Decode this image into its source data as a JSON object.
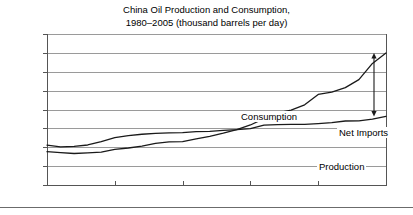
{
  "chart_data": {
    "type": "line",
    "title": "China Oil Production and Consumption,",
    "subtitle": "1980–2005 (thousand barrels per day)",
    "xlabel": "",
    "ylabel": "",
    "xlim": [
      1980,
      2005
    ],
    "ylim": [
      0,
      8000
    ],
    "grid": true,
    "legend_position": "inline-annotations",
    "x_ticks": [
      "1980",
      "1985",
      "1990",
      "1995",
      "2000",
      "2005"
    ],
    "x_tick_values": [
      1980,
      1985,
      1990,
      1995,
      2000,
      2005
    ],
    "y_ticks": [
      "0",
      "1,000",
      "2,000",
      "3,000",
      "4,000",
      "5,000",
      "6,000",
      "7,000",
      "8,000"
    ],
    "y_tick_values": [
      0,
      1000,
      2000,
      3000,
      4000,
      5000,
      6000,
      7000,
      8000
    ],
    "x": [
      1980,
      1981,
      1982,
      1983,
      1984,
      1985,
      1986,
      1987,
      1988,
      1989,
      1990,
      1991,
      1992,
      1993,
      1994,
      1995,
      1996,
      1997,
      1998,
      1999,
      2000,
      2001,
      2002,
      2003,
      2004,
      2005
    ],
    "series": [
      {
        "name": "Consumption",
        "values": [
          1765,
          1710,
          1670,
          1700,
          1740,
          1885,
          1960,
          2060,
          2210,
          2290,
          2300,
          2440,
          2580,
          2750,
          2940,
          3180,
          3520,
          3820,
          3970,
          4250,
          4800,
          4920,
          5160,
          5580,
          6440,
          6990
        ]
      },
      {
        "name": "Production",
        "values": [
          2114,
          2020,
          2045,
          2120,
          2295,
          2505,
          2620,
          2690,
          2730,
          2760,
          2780,
          2830,
          2840,
          2890,
          2930,
          2990,
          3170,
          3200,
          3210,
          3210,
          3250,
          3300,
          3390,
          3400,
          3490,
          3630
        ]
      }
    ],
    "annotations": [
      {
        "label": "Consumption",
        "series": "Consumption"
      },
      {
        "label": "Production",
        "series": "Production"
      },
      {
        "label": "Net Imports",
        "type": "double-arrow",
        "at_x": 2005,
        "from": 3630,
        "to": 6990
      }
    ],
    "colors": {
      "line": "#1a1a1a",
      "grid": "#9a9a9a",
      "axis": "#555555",
      "background": "#ffffff"
    }
  }
}
